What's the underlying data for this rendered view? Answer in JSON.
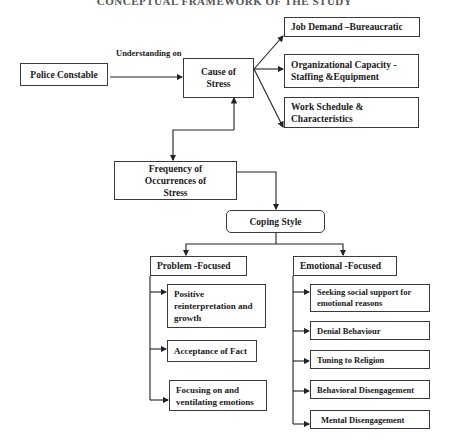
{
  "title": "CONCEPTUAL FRAMEWORK OF THE STUDY",
  "nodes": {
    "police_constable": "Police Constable",
    "understanding_on": "Understanding on",
    "cause_of_stress": "Cause of Stress",
    "frequency": "Frequency of Occurrences of Stress",
    "coping_style": "Coping Style",
    "problem_focused": "Problem -Focused",
    "emotional_focused": "Emotional -Focused"
  },
  "causes": [
    "Job Demand –Bureaucratic",
    "Organizational Capacity - Staffing &Equipment",
    "Work Schedule & Characteristics"
  ],
  "problem_focused_items": [
    "Positive reinterpretation and growth",
    "Acceptance of Fact",
    "Focusing on and ventilating emotions"
  ],
  "emotional_focused_items": [
    "Seeking social support for emotional reasons",
    "Denial Behaviour",
    "Tuning to Religion",
    "Behavioral Disengagement",
    "Mental Disengagement"
  ]
}
